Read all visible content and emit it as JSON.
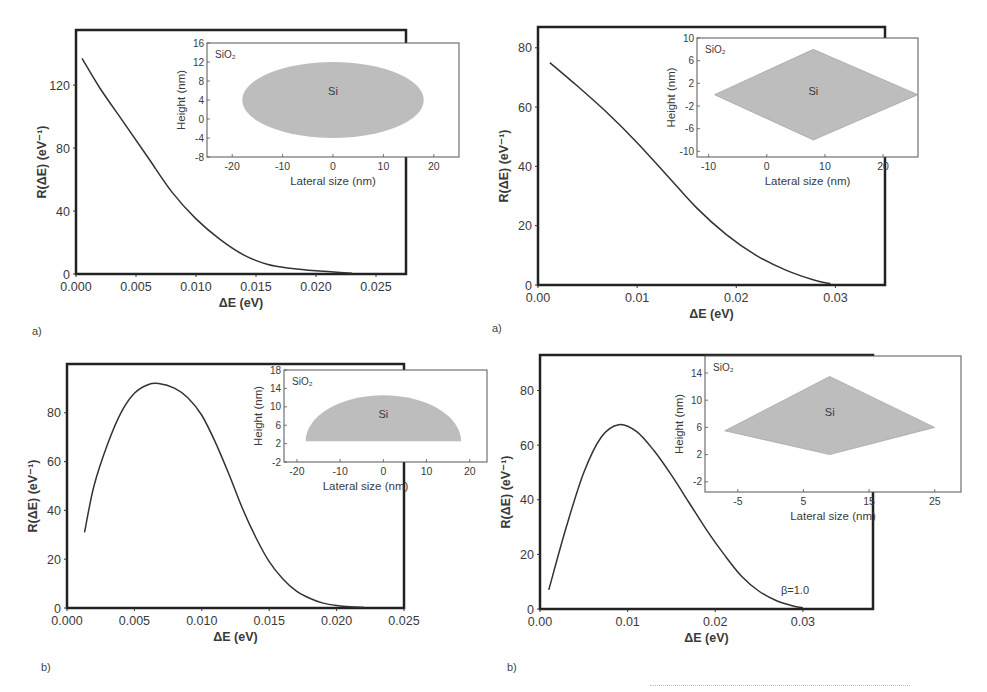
{
  "figure": {
    "panels": [
      {
        "id": "tl",
        "label": "a)"
      },
      {
        "id": "tr",
        "label": "a)"
      },
      {
        "id": "bl",
        "label": "b)"
      },
      {
        "id": "br",
        "label": "b)"
      }
    ]
  },
  "chart_data": [
    {
      "id": "top-left",
      "type": "line",
      "panel_label": "a)",
      "title": "",
      "xlabel": "ΔE  (eV)",
      "ylabel": "R(ΔE) (eV⁻¹)",
      "xlim": [
        0.0,
        0.0275
      ],
      "ylim": [
        0,
        155
      ],
      "xticks": [
        0.0,
        0.005,
        0.01,
        0.015,
        0.02,
        0.025
      ],
      "xtick_labels": [
        "0.000",
        "0.005",
        "0.010",
        "0.015",
        "0.020",
        "0.025"
      ],
      "yticks": [
        0,
        40,
        80,
        120
      ],
      "ytick_labels": [
        "0",
        "40",
        "80",
        "120"
      ],
      "series": [
        {
          "name": "R(ΔE)",
          "x": [
            0.0005,
            0.002,
            0.004,
            0.006,
            0.008,
            0.01,
            0.012,
            0.014,
            0.016,
            0.018,
            0.02,
            0.022,
            0.023
          ],
          "y": [
            137,
            118,
            96,
            74,
            52,
            35,
            22,
            12,
            6,
            3.5,
            2,
            1,
            0.5
          ]
        }
      ],
      "inset": {
        "shape": "ellipse",
        "label_matrix": "SiO₂",
        "label_dot": "Si",
        "xlabel": "Lateral size (nm)",
        "ylabel": "Height (nm)",
        "xlim": [
          -25,
          25
        ],
        "ylim": [
          -8,
          16
        ],
        "xticks": [
          -20,
          -10,
          0,
          10,
          20
        ],
        "xtick_labels": [
          "-20",
          "-10",
          "0",
          "10",
          "20"
        ],
        "yticks": [
          -8,
          -4,
          0,
          4,
          8,
          12,
          16
        ],
        "ytick_labels": [
          "-8",
          "-4",
          "0",
          "4",
          "8",
          "12",
          "16"
        ],
        "geometry": {
          "cx": 0,
          "cy": 4,
          "rx": 18,
          "ry": 8
        }
      }
    },
    {
      "id": "top-right",
      "type": "line",
      "panel_label": "a)",
      "title": "",
      "xlabel": "ΔE (eV)",
      "ylabel": "R(ΔE) (eV⁻¹)",
      "xlim": [
        0.0,
        0.035
      ],
      "ylim": [
        0,
        87
      ],
      "xticks": [
        0.0,
        0.01,
        0.02,
        0.03
      ],
      "xtick_labels": [
        "0.00",
        "0.01",
        "0.02",
        "0.03"
      ],
      "yticks": [
        0,
        20,
        40,
        60,
        80
      ],
      "ytick_labels": [
        "0",
        "20",
        "40",
        "60",
        "80"
      ],
      "series": [
        {
          "name": "R(ΔE)",
          "x": [
            0.0012,
            0.004,
            0.007,
            0.01,
            0.013,
            0.016,
            0.019,
            0.022,
            0.025,
            0.028,
            0.0295
          ],
          "y": [
            75,
            67,
            58,
            48,
            37,
            26,
            17,
            10,
            5,
            1.5,
            0.5
          ]
        }
      ],
      "inset": {
        "shape": "diamond",
        "label_matrix": "SiO₂",
        "label_dot": "Si",
        "xlabel": "Lateral size (nm)",
        "ylabel": "Height  (nm)",
        "xlim": [
          -12,
          26
        ],
        "ylim": [
          -11,
          10
        ],
        "xticks": [
          -10,
          0,
          10,
          20
        ],
        "xtick_labels": [
          "-10",
          "0",
          "10",
          "20"
        ],
        "yticks": [
          -10,
          -6,
          -2,
          2,
          6,
          10
        ],
        "ytick_labels": [
          "-10",
          "-6",
          "-2",
          "2",
          "6",
          "10"
        ],
        "geometry": {
          "points": [
            [
              -9,
              0
            ],
            [
              8,
              8
            ],
            [
              26,
              0
            ],
            [
              8,
              -8
            ]
          ]
        }
      }
    },
    {
      "id": "bottom-left",
      "type": "line",
      "panel_label": "b)",
      "title": "",
      "xlabel": "ΔE  (eV)",
      "ylabel": "R(ΔE) (eV⁻¹)",
      "xlim": [
        0.0,
        0.025
      ],
      "ylim": [
        0,
        100
      ],
      "xticks": [
        0.0,
        0.005,
        0.01,
        0.015,
        0.02,
        0.025
      ],
      "xtick_labels": [
        "0.000",
        "0.005",
        "0.010",
        "0.015",
        "0.020",
        "0.025"
      ],
      "yticks": [
        0,
        20,
        40,
        60,
        80
      ],
      "ytick_labels": [
        "0",
        "20",
        "40",
        "60",
        "80"
      ],
      "series": [
        {
          "name": "R(ΔE)",
          "x": [
            0.0013,
            0.002,
            0.003,
            0.004,
            0.005,
            0.006,
            0.0068,
            0.008,
            0.009,
            0.01,
            0.011,
            0.012,
            0.013,
            0.014,
            0.015,
            0.016,
            0.017,
            0.018,
            0.019,
            0.02,
            0.021,
            0.022
          ],
          "y": [
            31,
            50,
            67,
            80,
            88,
            91.5,
            92,
            90,
            86,
            79,
            68,
            55,
            41,
            29,
            19,
            12,
            7,
            4,
            2,
            1,
            0.5,
            0.3
          ]
        }
      ],
      "inset": {
        "shape": "half-ellipse",
        "label_matrix": "SiO₂",
        "label_dot": "Si",
        "xlabel": "Lateral size (nm)",
        "ylabel": "Height  (nm)",
        "xlim": [
          -23,
          24
        ],
        "ylim": [
          -2,
          18
        ],
        "xticks": [
          -20,
          -10,
          0,
          10,
          20
        ],
        "xtick_labels": [
          "-20",
          "-10",
          "0",
          "10",
          "20"
        ],
        "yticks": [
          -2,
          2,
          6,
          10,
          14,
          18
        ],
        "ytick_labels": [
          "-2",
          "2",
          "6",
          "10",
          "14",
          "18"
        ],
        "geometry": {
          "cx": 0,
          "base": 2.5,
          "rx": 18,
          "ry": 10
        }
      }
    },
    {
      "id": "bottom-right",
      "type": "line",
      "panel_label": "b)",
      "title": "",
      "xlabel": "ΔE (eV)",
      "ylabel": "R(ΔE) (eV⁻¹)",
      "xlim": [
        0.0,
        0.038
      ],
      "ylim": [
        0,
        93
      ],
      "xticks": [
        0.0,
        0.01,
        0.02,
        0.03
      ],
      "xtick_labels": [
        "0.00",
        "0.01",
        "0.02",
        "0.03"
      ],
      "yticks": [
        0,
        20,
        40,
        60,
        80
      ],
      "ytick_labels": [
        "0",
        "20",
        "40",
        "60",
        "80"
      ],
      "annotation": "β=1.0",
      "series": [
        {
          "name": "β=1.0",
          "x": [
            0.001,
            0.003,
            0.005,
            0.007,
            0.009,
            0.011,
            0.013,
            0.015,
            0.017,
            0.019,
            0.021,
            0.023,
            0.025,
            0.027,
            0.029,
            0.03
          ],
          "y": [
            7,
            30,
            50,
            63,
            67.5,
            65,
            58,
            49,
            39,
            29,
            20,
            12,
            6.5,
            3,
            1,
            0.5
          ]
        }
      ],
      "inset": {
        "shape": "diamond",
        "label_matrix": "SiO₂",
        "label_dot": "Si",
        "xlabel": "Lateral size (nm)",
        "ylabel": "Height  (nm)",
        "xlim": [
          -10,
          29
        ],
        "ylim": [
          -3.5,
          16.5
        ],
        "xticks": [
          -5,
          5,
          15,
          25
        ],
        "xtick_labels": [
          "-5",
          "5",
          "15",
          "25"
        ],
        "yticks": [
          -2,
          2,
          6,
          10,
          14
        ],
        "ytick_labels": [
          "-2",
          "2",
          "6",
          "10",
          "14"
        ],
        "geometry": {
          "points": [
            [
              -7,
              5.5
            ],
            [
              9,
              13.5
            ],
            [
              25,
              6
            ],
            [
              9,
              2
            ]
          ]
        }
      }
    }
  ]
}
